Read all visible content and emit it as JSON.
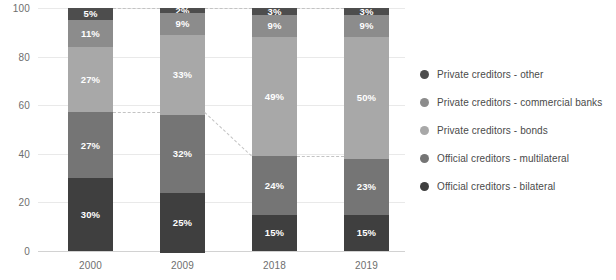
{
  "chart_data": {
    "type": "bar",
    "stacked": true,
    "stack_mode": "percent",
    "title": "",
    "subtitle": "",
    "xlabel": "",
    "ylabel": "",
    "categories": [
      "2000",
      "2009",
      "2018",
      "2019"
    ],
    "ylim": [
      0,
      100
    ],
    "yticks": [
      0,
      20,
      40,
      60,
      80,
      100
    ],
    "ytick_labels": [
      "0",
      "20",
      "40",
      "60",
      "80",
      "100"
    ],
    "grid": true,
    "legend_position": "right",
    "series": [
      {
        "name": "Private creditors - other",
        "color": "#4d4d4d",
        "values": [
          5,
          2,
          3,
          3
        ],
        "labels": [
          "5%",
          "2%",
          "3%",
          "3%"
        ]
      },
      {
        "name": "Private creditors - commercial banks",
        "color": "#8c8c8c",
        "values": [
          11,
          9,
          9,
          9
        ],
        "labels": [
          "11%",
          "9%",
          "9%",
          "9%"
        ]
      },
      {
        "name": "Private creditors - bonds",
        "color": "#a8a8a8",
        "values": [
          27,
          33,
          49,
          50
        ],
        "labels": [
          "27%",
          "33%",
          "49%",
          "50%"
        ]
      },
      {
        "name": "Official creditors - multilateral",
        "color": "#757575",
        "values": [
          27,
          32,
          24,
          23
        ],
        "labels": [
          "27%",
          "32%",
          "24%",
          "23%"
        ]
      },
      {
        "name": "Official creditors - bilateral",
        "color": "#3f3f3f",
        "values": [
          30,
          25,
          15,
          15
        ],
        "labels": [
          "30%",
          "25%",
          "15%",
          "15%"
        ]
      }
    ],
    "annotations": [
      {
        "name": "connector-top-2000-2009",
        "from": {
          "x": 0,
          "y": 100
        },
        "to": {
          "x": 1,
          "y": 100
        },
        "style": "dashed"
      },
      {
        "name": "connector-top-2009-2018",
        "from": {
          "x": 1,
          "y": 100
        },
        "to": {
          "x": 2,
          "y": 100
        },
        "style": "dashed"
      },
      {
        "name": "connector-top-2018-2019",
        "from": {
          "x": 2,
          "y": 100
        },
        "to": {
          "x": 3,
          "y": 100
        },
        "style": "dashed"
      },
      {
        "name": "connector-bonds-2000-2009",
        "from": {
          "x": 0,
          "y": 57
        },
        "to": {
          "x": 1,
          "y": 57
        },
        "style": "dashed"
      },
      {
        "name": "connector-bonds-2009-2018",
        "from": {
          "x": 1,
          "y": 57
        },
        "to": {
          "x": 2,
          "y": 39
        },
        "style": "dashed"
      },
      {
        "name": "connector-bonds-2018-2019",
        "from": {
          "x": 2,
          "y": 39
        },
        "to": {
          "x": 3,
          "y": 39
        },
        "style": "dashed"
      }
    ],
    "colors": {
      "axis_text": "#6e6e6e",
      "gridline": "#e9e9e9",
      "baseline": "#d2d2d2",
      "connector": "#c3c3c3",
      "label_text": "#ffffff",
      "legend_text": "#4a4a4a"
    }
  }
}
